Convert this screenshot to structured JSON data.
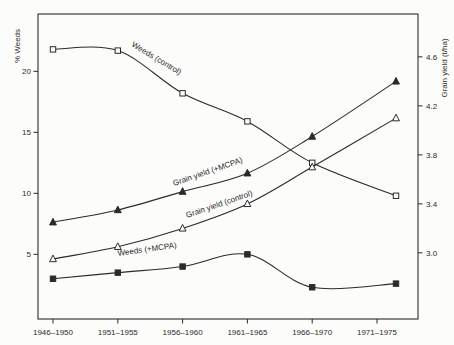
{
  "figure": {
    "paper_color": "#fcfcfa",
    "ink_color": "#2b2b2b"
  },
  "chart_data": {
    "type": "line",
    "title": "",
    "categories": [
      "1946–1950",
      "1951–1955",
      "1956–1960",
      "1961–1965",
      "1966–1970",
      "1971–1975"
    ],
    "axes": {
      "left": {
        "title": "% Weeds",
        "range": [
          -0.3,
          24.7
        ],
        "ticks": [
          {
            "value": 5,
            "label": "5"
          },
          {
            "value": 10,
            "label": "10"
          },
          {
            "value": 15,
            "label": "15"
          },
          {
            "value": 20,
            "label": "20"
          }
        ]
      },
      "right": {
        "title": "Grain yield (t/ha)",
        "range": [
          2.46,
          4.95
        ],
        "ticks": [
          {
            "value": 3.0,
            "label": "3.0"
          },
          {
            "value": 3.4,
            "label": "3.4"
          },
          {
            "value": 3.8,
            "label": "3.8"
          },
          {
            "value": 4.2,
            "label": "4.2"
          },
          {
            "value": 4.6,
            "label": "4.6"
          }
        ]
      }
    },
    "series": [
      {
        "name": "Weeds (control)",
        "axis": "left",
        "marker": "open-square",
        "values": [
          21.8,
          21.7,
          18.2,
          15.9,
          12.5,
          9.8
        ]
      },
      {
        "name": "Weeds (+MCPA)",
        "axis": "left",
        "marker": "filled-square",
        "values": [
          3.0,
          3.5,
          4.0,
          5.0,
          2.3,
          2.6
        ]
      },
      {
        "name": "Grain yield (+MCPA)",
        "axis": "right",
        "marker": "filled-triangle",
        "values": [
          3.25,
          3.35,
          3.5,
          3.65,
          3.95,
          4.4
        ]
      },
      {
        "name": "Grain yield (control)",
        "axis": "right",
        "marker": "open-triangle",
        "values": [
          2.95,
          3.05,
          3.2,
          3.4,
          3.7,
          4.1
        ]
      }
    ],
    "curve_labels": [
      {
        "text": "Weeds (control)",
        "x": 131,
        "y": 46,
        "angle": 31
      },
      {
        "text": "Grain yield (+MCPA)",
        "x": 174,
        "y": 186,
        "angle": -19
      },
      {
        "text": "Grain yield (control)",
        "x": 187,
        "y": 218,
        "angle": -19
      },
      {
        "text": "Weeds (+MCPA)",
        "x": 118,
        "y": 256,
        "angle": -8
      }
    ],
    "grid": false,
    "legend": "inline-curve-labels"
  }
}
